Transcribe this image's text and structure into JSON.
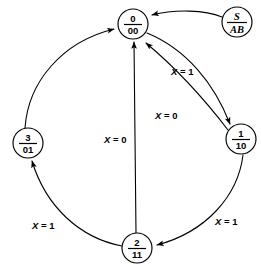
{
  "diagram": {
    "type": "state-diagram",
    "nodes": [
      {
        "id": "s0",
        "state": "0",
        "output": "00",
        "cx": 133,
        "cy": 24,
        "r": 15,
        "italic": false
      },
      {
        "id": "s1",
        "state": "1",
        "output": "10",
        "cx": 241,
        "cy": 139,
        "r": 15,
        "italic": false
      },
      {
        "id": "s2",
        "state": "2",
        "output": "11",
        "cx": 137,
        "cy": 248,
        "r": 15,
        "italic": false
      },
      {
        "id": "s3",
        "state": "3",
        "output": "01",
        "cx": 28,
        "cy": 143,
        "r": 15,
        "italic": false
      },
      {
        "id": "sinit",
        "state": "S",
        "output": "AB",
        "cx": 237,
        "cy": 22,
        "r": 15,
        "italic": true
      }
    ],
    "edges": [
      {
        "id": "e-init-0",
        "from": "sinit",
        "to": "s0",
        "label": ""
      },
      {
        "id": "e-0-1",
        "from": "s0",
        "to": "s1",
        "label": "X = 1"
      },
      {
        "id": "e-1-0",
        "from": "s1",
        "to": "s0",
        "label": "X = 0"
      },
      {
        "id": "e-1-2",
        "from": "s1",
        "to": "s2",
        "label": "X = 1"
      },
      {
        "id": "e-2-0",
        "from": "s2",
        "to": "s0",
        "label": "X = 0"
      },
      {
        "id": "e-2-3",
        "from": "s2",
        "to": "s3",
        "label": "X = 1"
      },
      {
        "id": "e-3-0",
        "from": "s3",
        "to": "s0",
        "label": ""
      }
    ],
    "labels": [
      {
        "id": "lbl-x1-top",
        "var": "X",
        "eq": " = ",
        "val": "1",
        "x": 171,
        "y": 66
      },
      {
        "id": "lbl-x0-right",
        "var": "X",
        "eq": " = ",
        "val": "0",
        "x": 155,
        "y": 110
      },
      {
        "id": "lbl-x0-center",
        "var": "X",
        "eq": " = ",
        "val": "0",
        "x": 104,
        "y": 134
      },
      {
        "id": "lbl-x1-left",
        "var": "X",
        "eq": " = ",
        "val": "1",
        "x": 32,
        "y": 220
      },
      {
        "id": "lbl-x1-right",
        "var": "X",
        "eq": " = ",
        "val": "1",
        "x": 215,
        "y": 216
      }
    ],
    "colors": {
      "stroke": "#000000",
      "fill": "#ffffff",
      "background": "#ffffff"
    }
  }
}
